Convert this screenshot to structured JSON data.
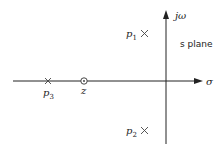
{
  "diagram": {
    "axes": {
      "horizontal_label": "σ",
      "vertical_label": "jω",
      "plane_label": "s plane"
    },
    "poles": [
      {
        "name": "p1",
        "label_main": "p",
        "label_sub": "1",
        "marker": "×",
        "position": "upper-left quadrant"
      },
      {
        "name": "p2",
        "label_main": "p",
        "label_sub": "2",
        "marker": "×",
        "position": "lower-left quadrant"
      },
      {
        "name": "p3",
        "label_main": "p",
        "label_sub": "3",
        "marker": "×",
        "position": "negative real axis"
      }
    ],
    "zeros": [
      {
        "name": "z",
        "label": "z",
        "marker": "⊙",
        "position": "negative real axis, right of p3"
      }
    ],
    "colors": {
      "ink": "#222222",
      "background": "#ffffff"
    }
  }
}
